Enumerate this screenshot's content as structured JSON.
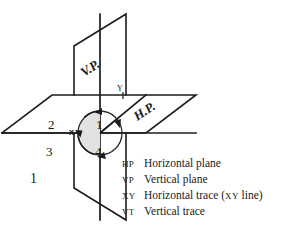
{
  "figure": {
    "number": "1",
    "background_color": "#ffffff",
    "ink_color": "#1c1c1c",
    "shade_color": "#e2e2e2"
  },
  "planes": {
    "vertical_label": "V.P.",
    "horizontal_label": "H.P."
  },
  "axis": {
    "y_label": "Y"
  },
  "quadrants": {
    "center_marker": "x",
    "first": "1",
    "second": "2",
    "third": "3",
    "fourth": "4"
  },
  "legend": {
    "rows": [
      {
        "abbr": "HP",
        "text": "Horizontal plane"
      },
      {
        "abbr": "VP",
        "text": "Vertical plane"
      },
      {
        "abbr": "XY",
        "text_before": "Horizontal trace (",
        "text_small": "XY",
        "text_after": " line)"
      },
      {
        "abbr": "VT",
        "text": "Vertical trace"
      }
    ]
  }
}
